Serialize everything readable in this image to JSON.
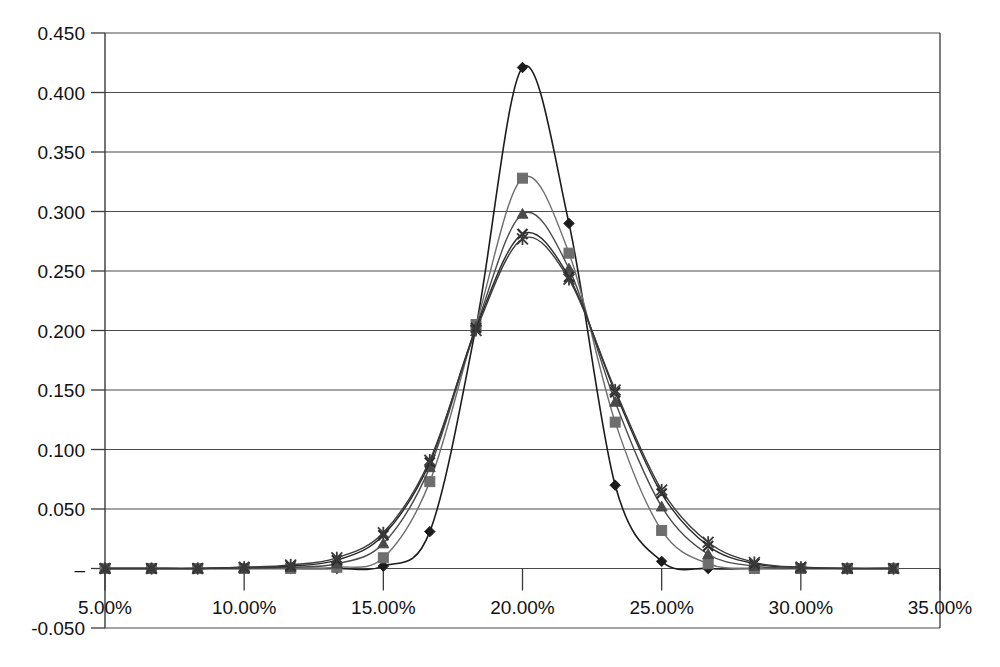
{
  "chart_data": {
    "type": "line",
    "title": "",
    "subtitle": "",
    "xlabel": "",
    "ylabel": "",
    "grid": "horizontal",
    "legend_position": "none",
    "xlim": [
      0.05,
      0.35
    ],
    "ylim": [
      -0.05,
      0.45
    ],
    "x_tick_labels": [
      "5.00%",
      "10.00%",
      "15.00%",
      "20.00%",
      "25.00%",
      "30.00%",
      "35.00%"
    ],
    "x_tick_values": [
      0.05,
      0.1,
      0.15,
      0.2,
      0.25,
      0.3,
      0.35
    ],
    "y_tick_labels": [
      "0.450",
      "0.400",
      "0.350",
      "0.300",
      "0.250",
      "0.200",
      "0.150",
      "0.100",
      "0.050",
      "–",
      "-0.050"
    ],
    "y_tick_values": [
      0.45,
      0.4,
      0.35,
      0.3,
      0.25,
      0.2,
      0.15,
      0.1,
      0.05,
      0.0,
      -0.05
    ],
    "zero_label": "–",
    "x": [
      0.05,
      0.0667,
      0.0833,
      0.1,
      0.1167,
      0.1333,
      0.15,
      0.1667,
      0.1833,
      0.2,
      0.2167,
      0.2333,
      0.25,
      0.2667,
      0.2833,
      0.3,
      0.3167,
      0.3333
    ],
    "series": [
      {
        "name": "Series 1",
        "marker": "diamond",
        "color": "#1c1c1c",
        "values": [
          0.0,
          0.0,
          0.0,
          0.0,
          0.0,
          0.0,
          0.002,
          0.031,
          0.203,
          0.421,
          0.29,
          0.07,
          0.006,
          0.0,
          0.0,
          0.0,
          0.0,
          0.0
        ]
      },
      {
        "name": "Series 2",
        "marker": "square",
        "color": "#6e6e6e",
        "values": [
          0.0,
          0.0,
          0.0,
          0.0,
          0.0,
          0.001,
          0.009,
          0.073,
          0.205,
          0.328,
          0.265,
          0.123,
          0.032,
          0.004,
          0.0,
          0.0,
          0.0,
          0.0
        ]
      },
      {
        "name": "Series 3",
        "marker": "triangle",
        "color": "#4a4a4a",
        "values": [
          0.0,
          0.0,
          0.0,
          0.0,
          0.001,
          0.004,
          0.021,
          0.085,
          0.203,
          0.298,
          0.252,
          0.14,
          0.052,
          0.012,
          0.002,
          0.0,
          0.0,
          0.0
        ]
      },
      {
        "name": "Series 4",
        "marker": "x",
        "color": "#2a2a2a",
        "values": [
          0.0,
          0.0,
          0.0,
          0.001,
          0.002,
          0.007,
          0.028,
          0.089,
          0.202,
          0.281,
          0.245,
          0.148,
          0.063,
          0.019,
          0.004,
          0.001,
          0.0,
          0.0
        ]
      },
      {
        "name": "Series 5",
        "marker": "star",
        "color": "#3a3a3a",
        "values": [
          0.0,
          0.0,
          0.0,
          0.001,
          0.003,
          0.009,
          0.03,
          0.091,
          0.2,
          0.277,
          0.243,
          0.15,
          0.066,
          0.022,
          0.005,
          0.001,
          0.0,
          0.0
        ]
      }
    ]
  },
  "axes": {
    "y_axis_name": "value-axis",
    "x_axis_name": "category-axis"
  }
}
